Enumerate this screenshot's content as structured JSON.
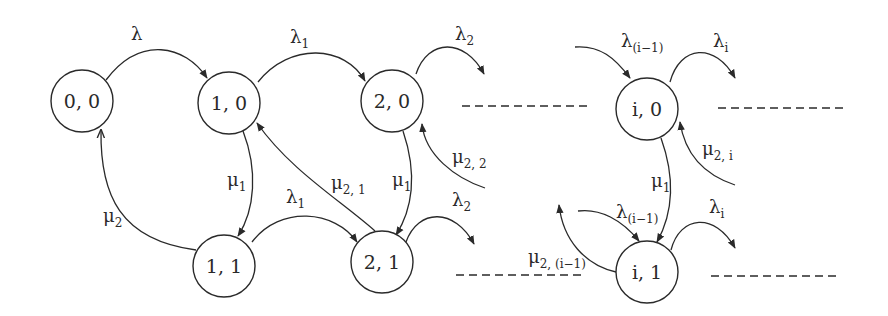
{
  "diagram": {
    "type": "state-transition",
    "stroke_color": "#2a2a2a",
    "background": "#ffffff",
    "nodes": [
      {
        "id": "n00",
        "label": "0, 0",
        "cx": 82,
        "cy": 101,
        "r": 31
      },
      {
        "id": "n10",
        "label": "1, 0",
        "cx": 229,
        "cy": 103,
        "r": 31
      },
      {
        "id": "n20",
        "label": "2, 0",
        "cx": 392,
        "cy": 101,
        "r": 31
      },
      {
        "id": "n11",
        "label": "1, 1",
        "cx": 224,
        "cy": 266,
        "r": 31
      },
      {
        "id": "n21",
        "label": "2, 1",
        "cx": 382,
        "cy": 262,
        "r": 31
      },
      {
        "id": "ni0",
        "label": "i, 0",
        "cx": 647,
        "cy": 109,
        "r": 31
      },
      {
        "id": "ni1",
        "label": "i, 1",
        "cx": 647,
        "cy": 272,
        "r": 31
      }
    ],
    "labels": {
      "l_00_10": {
        "base": "λ",
        "sub": ""
      },
      "l_10_20": {
        "base": "λ",
        "sub": "1"
      },
      "l_20_out": {
        "base": "λ",
        "sub": "2"
      },
      "l_10_11": {
        "base": "μ",
        "sub": "1"
      },
      "l_11_00": {
        "base": "μ",
        "sub": "2"
      },
      "l_11_21": {
        "base": "λ",
        "sub": "1"
      },
      "l_21_10": {
        "base": "μ",
        "sub": "2, 1"
      },
      "l_20_21": {
        "base": "μ",
        "sub": "1"
      },
      "l_in_20": {
        "base": "μ",
        "sub": "2, 2"
      },
      "l_21_out": {
        "base": "λ",
        "sub": "2"
      },
      "l_in_i0": {
        "base": "λ",
        "sub": "(i−1)"
      },
      "l_i0_out": {
        "base": "λ",
        "sub": "i"
      },
      "l_in2_i0": {
        "base": "μ",
        "sub": "2, i"
      },
      "l_i0_i1": {
        "base": "μ",
        "sub": "1"
      },
      "l_in_i1": {
        "base": "λ",
        "sub": "(i−1)"
      },
      "l_i1_back": {
        "base": "μ",
        "sub": "2, (i−1)"
      },
      "l_i1_out": {
        "base": "λ",
        "sub": "i"
      }
    },
    "continuation_dashes": [
      {
        "x1": 462,
        "y1": 106,
        "x2": 588,
        "y2": 106
      },
      {
        "x1": 718,
        "y1": 108,
        "x2": 843,
        "y2": 108
      },
      {
        "x1": 456,
        "y1": 275,
        "x2": 582,
        "y2": 275
      },
      {
        "x1": 711,
        "y1": 276,
        "x2": 836,
        "y2": 276
      }
    ]
  }
}
